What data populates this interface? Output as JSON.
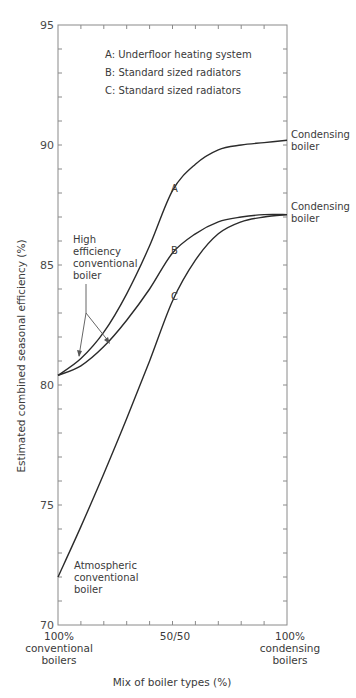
{
  "chart_data": {
    "type": "line",
    "title": "",
    "xlabel": "Mix of boiler types (%)",
    "ylabel": "Estimated combined seasonal efficiency (%)",
    "ylim": [
      70,
      95
    ],
    "xlim": [
      0,
      100
    ],
    "grid": false,
    "y_ticks": [
      70,
      75,
      80,
      85,
      90,
      95
    ],
    "y_tick_labels": [
      "70",
      "75",
      "80",
      "85",
      "90",
      "95"
    ],
    "x_tick_labels": [
      {
        "x": 0,
        "lines": [
          "100%",
          "conventional",
          "boilers"
        ]
      },
      {
        "x": 50,
        "lines": [
          "50/50"
        ]
      },
      {
        "x": 100,
        "lines": [
          "100%",
          "condensing",
          "boilers"
        ]
      }
    ],
    "x": [
      0,
      10,
      20,
      30,
      40,
      50,
      60,
      70,
      80,
      90,
      100
    ],
    "series": [
      {
        "name": "A",
        "label": "A: Underfloor heating system",
        "values": [
          80.4,
          81.1,
          82.2,
          83.8,
          85.8,
          88.1,
          89.2,
          89.8,
          90.0,
          90.1,
          90.2
        ]
      },
      {
        "name": "B",
        "label": "B: Standard sized radiators",
        "values": [
          80.4,
          80.8,
          81.6,
          82.7,
          84.0,
          85.5,
          86.3,
          86.8,
          87.0,
          87.1,
          87.1
        ]
      },
      {
        "name": "C",
        "label": "C: Standard sized radiators",
        "values": [
          72.0,
          74.1,
          76.3,
          78.6,
          81.0,
          83.5,
          85.2,
          86.3,
          86.8,
          87.0,
          87.1
        ]
      }
    ],
    "legend": {
      "position": "top-center-inside",
      "entries": [
        "A: Underfloor heating system",
        "B: Standard sized radiators",
        "C: Standard sized radiators"
      ]
    },
    "annotations": [
      {
        "text": [
          "High",
          "efficiency",
          "conventional",
          "boiler"
        ],
        "points_to": [
          "A",
          "B"
        ],
        "at_x": 5
      },
      {
        "text": [
          "Atmospheric",
          "conventional",
          "boiler"
        ],
        "points_to": [
          "C"
        ],
        "at_x": 0
      },
      {
        "text": [
          "Condensing",
          "boiler"
        ],
        "points_to": [
          "A"
        ],
        "at_x": 100
      },
      {
        "text": [
          "Condensing",
          "boiler"
        ],
        "points_to": [
          "B",
          "C"
        ],
        "at_x": 100
      }
    ]
  },
  "labels": {
    "legend": [
      "A: Underfloor heating system",
      "B: Standard sized radiators",
      "C: Standard sized radiators"
    ],
    "curve_letters": [
      "A",
      "B",
      "C"
    ],
    "yticks": [
      "95",
      "90",
      "85",
      "80",
      "75",
      "70"
    ],
    "xtick_left": [
      "100%",
      "conventional",
      "boilers"
    ],
    "xtick_mid": "50/50",
    "xtick_right": [
      "100%",
      "condensing",
      "boilers"
    ],
    "xlabel": "Mix of boiler types (%)",
    "ylabel": "Estimated combined seasonal efficiency (%)",
    "high_eff": [
      "High",
      "efficiency",
      "conventional",
      "boiler"
    ],
    "atmospheric": [
      "Atmospheric",
      "conventional",
      "boiler"
    ],
    "condensing_top": [
      "Condensing",
      "boiler"
    ],
    "condensing_bottom": [
      "Condensing",
      "boiler"
    ]
  },
  "colors": {
    "curve": "#2b2b2b",
    "axis": "#8a8a8a",
    "text": "#3a3a3a",
    "background": "#ffffff"
  }
}
